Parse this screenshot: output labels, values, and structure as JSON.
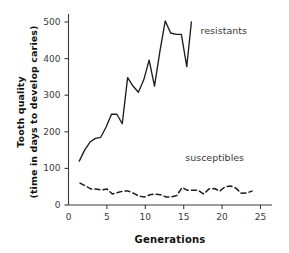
{
  "chart_data": {
    "type": "line",
    "title": "",
    "xlabel": "Generations",
    "ylabel_line1": "Tooth quality",
    "ylabel_line2": "(time in days to develop caries)",
    "xlim": [
      0,
      26.5
    ],
    "ylim": [
      0,
      540
    ],
    "xticks": [
      0,
      5,
      10,
      15,
      20,
      25
    ],
    "yticks": [
      0,
      100,
      200,
      300,
      400,
      500
    ],
    "grid": false,
    "legend_position": "inline-annotation",
    "series": [
      {
        "name": "resistants",
        "style": "solid",
        "label_text": "resistants",
        "x": [
          1.4,
          2.1,
          2.8,
          3.5,
          4.2,
          4.9,
          5.6,
          6.3,
          7.0,
          7.7,
          8.4,
          9.1,
          9.8,
          10.5,
          11.2,
          11.9,
          12.6,
          13.3,
          14.0,
          14.7,
          15.4,
          16.0
        ],
        "values": [
          120,
          150,
          172,
          182,
          185,
          213,
          248,
          248,
          222,
          348,
          325,
          308,
          342,
          396,
          325,
          420,
          503,
          470,
          466,
          466,
          378,
          500
        ]
      },
      {
        "name": "susceptibles",
        "style": "dashed",
        "label_text": "susceptibles",
        "x": [
          1.5,
          2.2,
          2.9,
          3.6,
          4.3,
          5.0,
          5.7,
          6.4,
          7.1,
          7.8,
          8.5,
          9.2,
          9.9,
          10.6,
          11.3,
          12.0,
          12.7,
          13.4,
          14.1,
          14.8,
          15.5,
          16.2,
          16.9,
          17.6,
          18.3,
          19.0,
          19.7,
          20.4,
          21.1,
          21.8,
          22.5,
          23.2,
          23.9
        ],
        "values": [
          60,
          52,
          44,
          44,
          41,
          44,
          30,
          34,
          38,
          38,
          32,
          24,
          22,
          28,
          30,
          28,
          22,
          22,
          26,
          48,
          40,
          40,
          40,
          30,
          44,
          45,
          38,
          50,
          52,
          46,
          32,
          33,
          38
        ]
      }
    ],
    "annotations": [
      {
        "text": "resistants",
        "x": 17.2,
        "y": 466
      },
      {
        "text": "susceptibles",
        "x": 15.2,
        "y": 120
      }
    ]
  }
}
